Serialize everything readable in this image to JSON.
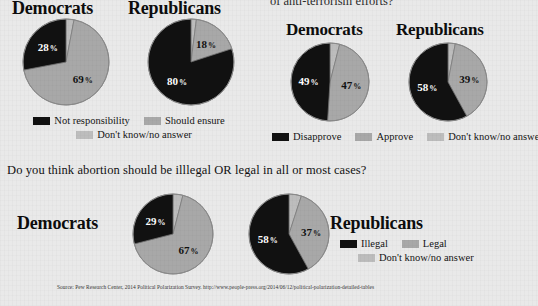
{
  "colors": {
    "background": "#e9e9e9",
    "dark": "#111111",
    "mid_gray": "#a8a8a8",
    "light_gray": "#bdbdbd",
    "text": "#111111",
    "stroke": "#8a8a8a"
  },
  "top_right_question_clipped": "of anti-terrorism efforts?",
  "bottom_question": "Do you think abortion should be illlegal OR legal in all or most cases?",
  "source": "Source: Pew Research Center, 2014 Political Polarization Survey. http://www.people-press.org/2014/06/12/political-polarization-detailed-tables",
  "panels": [
    {
      "id": "responsibility",
      "democrats_label": "Democrats",
      "republicans_label": "Republicans",
      "legend": [
        {
          "label": "Not responsibility",
          "color": "#111111"
        },
        {
          "label": "Should ensure",
          "color": "#a8a8a8"
        },
        {
          "label": "Don't know/no answer",
          "color": "#bdbdbd"
        }
      ]
    },
    {
      "id": "antiterrorism",
      "democrats_label": "Democrats",
      "republicans_label": "Republicans",
      "legend": [
        {
          "label": "Disapprove",
          "color": "#111111"
        },
        {
          "label": "Approve",
          "color": "#a8a8a8"
        },
        {
          "label": "Don't know/no answer",
          "color": "#bdbdbd"
        }
      ]
    },
    {
      "id": "abortion",
      "democrats_label": "Democrats",
      "republicans_label": "Republicans",
      "legend": [
        {
          "label": "Illegal",
          "color": "#111111"
        },
        {
          "label": "Legal",
          "color": "#a8a8a8"
        },
        {
          "label": "Don't know/no answer",
          "color": "#bdbdbd"
        }
      ]
    }
  ],
  "chart_data": [
    {
      "type": "pie",
      "id": "responsibility-democrats",
      "title": "Democrats",
      "labels": [
        "Not responsibility",
        "Should ensure",
        "Don't know/no answer"
      ],
      "values": [
        28,
        69,
        3
      ],
      "colors": [
        "#111111",
        "#a8a8a8",
        "#bdbdbd"
      ],
      "visible_labels": [
        "28 %",
        "69 %",
        ""
      ],
      "legend_position": "bottom"
    },
    {
      "type": "pie",
      "id": "responsibility-republicans",
      "title": "Republicans",
      "labels": [
        "Not responsibility",
        "Should ensure",
        "Don't know/no answer"
      ],
      "values": [
        80,
        18,
        2
      ],
      "colors": [
        "#111111",
        "#a8a8a8",
        "#bdbdbd"
      ],
      "visible_labels": [
        "80 %",
        "18 %",
        ""
      ],
      "legend_position": "bottom"
    },
    {
      "type": "pie",
      "id": "antiterrorism-democrats",
      "title": "Democrats",
      "labels": [
        "Disapprove",
        "Approve",
        "Don't know/no answer"
      ],
      "values": [
        49,
        47,
        4
      ],
      "colors": [
        "#111111",
        "#a8a8a8",
        "#bdbdbd"
      ],
      "visible_labels": [
        "49 %",
        "47 %",
        ""
      ],
      "legend_position": "bottom"
    },
    {
      "type": "pie",
      "id": "antiterrorism-republicans",
      "title": "Republicans",
      "labels": [
        "Disapprove",
        "Approve",
        "Don't know/no answer"
      ],
      "values": [
        58,
        39,
        3
      ],
      "colors": [
        "#111111",
        "#a8a8a8",
        "#bdbdbd"
      ],
      "visible_labels": [
        "58 %",
        "39 %",
        ""
      ],
      "legend_position": "bottom"
    },
    {
      "type": "pie",
      "id": "abortion-democrats",
      "title": "Democrats",
      "labels": [
        "Illegal",
        "Legal",
        "Don't know/no answer"
      ],
      "values": [
        29,
        67,
        4
      ],
      "colors": [
        "#111111",
        "#a8a8a8",
        "#bdbdbd"
      ],
      "visible_labels": [
        "29 %",
        "67 %",
        ""
      ],
      "legend_position": "right"
    },
    {
      "type": "pie",
      "id": "abortion-republicans",
      "title": "Republicans",
      "labels": [
        "Illegal",
        "Legal",
        "Don't know/no answer"
      ],
      "values": [
        58,
        37,
        5
      ],
      "colors": [
        "#111111",
        "#a8a8a8",
        "#bdbdbd"
      ],
      "visible_labels": [
        "58 %",
        "37 %",
        ""
      ],
      "legend_position": "right"
    }
  ]
}
